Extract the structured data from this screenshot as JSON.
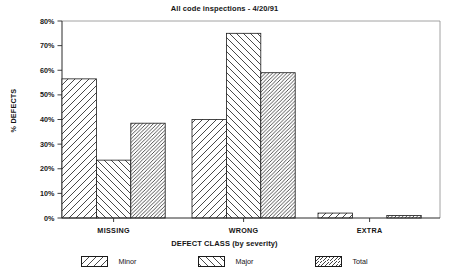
{
  "chart_data": {
    "type": "bar",
    "title": "All code inspections - 4/20/91",
    "xlabel": "DEFECT CLASS (by severity)",
    "ylabel": "% DEFECTS",
    "categories": [
      "MISSING",
      "WRONG",
      "EXTRA"
    ],
    "series": [
      {
        "name": "Minor",
        "pattern": "forward-hatch",
        "values": [
          56.5,
          40.0,
          2.0
        ]
      },
      {
        "name": "Major",
        "pattern": "backward-hatch",
        "values": [
          23.5,
          75.0,
          0.0
        ]
      },
      {
        "name": "Total",
        "pattern": "dense-hatch",
        "values": [
          38.5,
          59.0,
          1.0
        ]
      }
    ],
    "ylim": [
      0,
      80
    ],
    "ytick_labels": [
      "0%",
      "10%",
      "20%",
      "30%",
      "40%",
      "50%",
      "60%",
      "70%",
      "80%"
    ],
    "ytick_values": [
      0,
      10,
      20,
      30,
      40,
      50,
      60,
      70,
      80
    ],
    "grid": false,
    "legend_position": "bottom",
    "bar_fill_color": "#ffffff",
    "bar_line_color": "#1a1a1a",
    "axis_color": "#1a1a1a"
  },
  "legend": {
    "entries": [
      {
        "label": "Minor"
      },
      {
        "label": "Major"
      },
      {
        "label": "Total"
      }
    ]
  }
}
